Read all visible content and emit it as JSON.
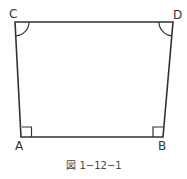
{
  "figure": {
    "caption": "図 1−12−1",
    "vertices": {
      "A": {
        "label": "A",
        "x": 21,
        "y": 137
      },
      "B": {
        "label": "B",
        "x": 163,
        "y": 137
      },
      "C": {
        "label": "C",
        "x": 15,
        "y": 22
      },
      "D": {
        "label": "D",
        "x": 173,
        "y": 22
      }
    },
    "angle_marks": {
      "A": "right-angle",
      "B": "right-angle",
      "C": "arc",
      "D": "arc"
    },
    "colors": {
      "stroke": "#333333",
      "background": "#ffffff"
    }
  }
}
